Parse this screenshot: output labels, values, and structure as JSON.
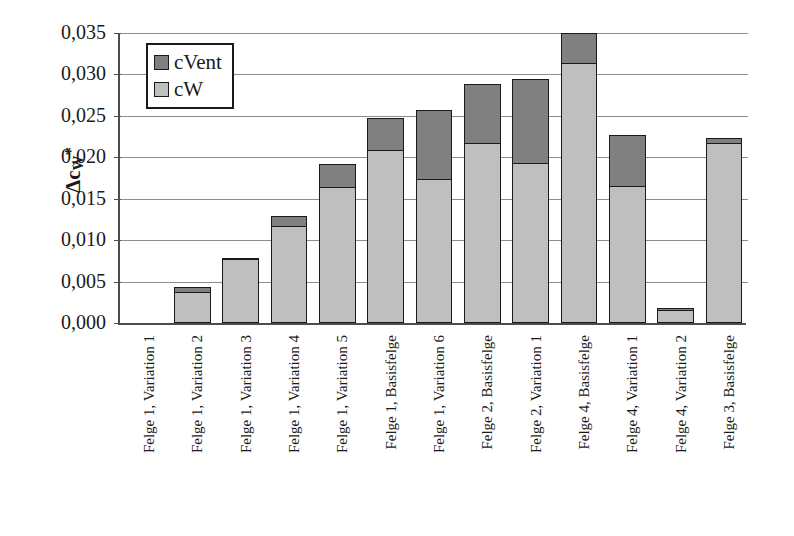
{
  "chart_data": {
    "type": "bar",
    "subtype": "stacked-bar",
    "title": "",
    "xlabel": "",
    "ylabel": "Δcw*",
    "ylabel_parts": {
      "delta": "Δ",
      "base": "c",
      "sub": "W",
      "sup": "*"
    },
    "ylim": [
      0.0,
      0.035
    ],
    "ytick_labels": [
      "0,035",
      "0,030",
      "0,025",
      "0,020",
      "0,015",
      "0,010",
      "0,005",
      "0,000"
    ],
    "ytick_values": [
      0.035,
      0.03,
      0.025,
      0.02,
      0.015,
      0.01,
      0.005,
      0.0
    ],
    "grid": true,
    "grid_axis": "y",
    "legend_position": "top-left-inside",
    "decimal_separator": ",",
    "categories": [
      "Felge 1, Variation 1",
      "Felge 1, Variation 2",
      "Felge 1, Variation 3",
      "Felge 1, Variation 4",
      "Felge 1, Variation 5",
      "Felge 1, Basisfelge",
      "Felge 1, Variation 6",
      "Felge 2, Basisfelge",
      "Felge 2, Variation 1",
      "Felge 4, Basisfelge",
      "Felge 4, Variation 1",
      "Felge 4, Variation 2",
      "Felge 3, Basisfelge"
    ],
    "series": [
      {
        "name": "cW",
        "color": "#bfbfbf",
        "values": [
          0.0,
          0.0038,
          0.0077,
          0.0117,
          0.0164,
          0.0209,
          0.0174,
          0.0217,
          0.0193,
          0.0314,
          0.0165,
          0.0016,
          0.0217
        ]
      },
      {
        "name": "cVent",
        "color": "#808080",
        "values": [
          0.0,
          0.0005,
          0.0002,
          0.0012,
          0.0028,
          0.0038,
          0.0083,
          0.0071,
          0.0102,
          0.0036,
          0.0062,
          0.0002,
          0.0006
        ]
      }
    ],
    "totals": [
      0.0,
      0.0043,
      0.0079,
      0.0129,
      0.0192,
      0.0247,
      0.0257,
      0.0288,
      0.0295,
      0.035,
      0.0227,
      0.0018,
      0.0223
    ]
  },
  "legend": {
    "entries": [
      {
        "label": "cVent",
        "swatch": "cvent-swatch"
      },
      {
        "label": "cW",
        "swatch": "cw-swatch"
      }
    ]
  }
}
